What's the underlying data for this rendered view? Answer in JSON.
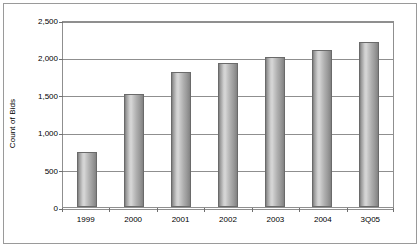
{
  "chart_data": {
    "type": "bar",
    "title": "",
    "xlabel": "",
    "ylabel": "Count of Bids",
    "categories": [
      "1999",
      "2000",
      "2001",
      "2002",
      "2003",
      "2004",
      "3Q05"
    ],
    "values": [
      740,
      1510,
      1800,
      1930,
      2000,
      2100,
      2200
    ],
    "ylim": [
      0,
      2500
    ],
    "ytick_labels": [
      "0",
      "500",
      "1,000",
      "1,500",
      "2,000",
      "2,500"
    ],
    "ytick_values": [
      0,
      500,
      1000,
      1500,
      2000,
      2500
    ],
    "grid": true,
    "legend": "none",
    "bar_color": "#b5b5b5",
    "bar_border_color": "#6a6a6a",
    "grid_color": "#8f8f8f",
    "frame_color": "#9a9a9a",
    "text_color": "#000000"
  }
}
